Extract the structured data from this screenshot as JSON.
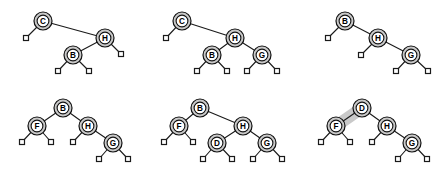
{
  "figure": {
    "background_color": "#ffffff",
    "node_fill": "#c9c9c9",
    "node_inner_fill": "#ffffff",
    "node_stroke": "#111111",
    "edge_color": "#1a1a1a",
    "leaf_fill": "#ffffff",
    "highlight_color": "#c9c9c9",
    "columns": 3,
    "rows": 2,
    "panel_width": 149,
    "panel_height": 88
  },
  "panels": [
    {
      "id": "panel-1",
      "index": 1,
      "x": 0,
      "y": 0,
      "root": "C",
      "node_labels": [
        "C",
        "H",
        "B"
      ],
      "leaf_count": 4,
      "highlight": null,
      "nodes": [
        {
          "label": "C",
          "x": 43,
          "y": 21,
          "r": 9
        },
        {
          "label": "H",
          "x": 105,
          "y": 38,
          "r": 9
        },
        {
          "label": "B",
          "x": 73,
          "y": 55,
          "r": 9
        }
      ],
      "leaves": [
        {
          "x": 26,
          "y": 38,
          "s": 5
        },
        {
          "x": 121,
          "y": 54,
          "s": 5
        },
        {
          "x": 58,
          "y": 71,
          "s": 5
        },
        {
          "x": 89,
          "y": 71,
          "s": 5
        }
      ],
      "edges": [
        {
          "from": "C",
          "to": "leaf",
          "x1": 43,
          "y1": 21,
          "x2": 26,
          "y2": 38
        },
        {
          "from": "C",
          "to": "H",
          "x1": 43,
          "y1": 21,
          "x2": 105,
          "y2": 38
        },
        {
          "from": "H",
          "to": "B",
          "x1": 105,
          "y1": 38,
          "x2": 73,
          "y2": 55
        },
        {
          "from": "H",
          "to": "leaf",
          "x1": 105,
          "y1": 38,
          "x2": 121,
          "y2": 54
        },
        {
          "from": "B",
          "to": "leaf",
          "x1": 73,
          "y1": 55,
          "x2": 58,
          "y2": 71
        },
        {
          "from": "B",
          "to": "leaf",
          "x1": 73,
          "y1": 55,
          "x2": 89,
          "y2": 71
        }
      ]
    },
    {
      "id": "panel-2",
      "index": 2,
      "x": 149,
      "y": 0,
      "root": "C",
      "node_labels": [
        "C",
        "H",
        "B",
        "G"
      ],
      "leaf_count": 5,
      "highlight": null,
      "nodes": [
        {
          "label": "C",
          "x": 33,
          "y": 21,
          "r": 9
        },
        {
          "label": "H",
          "x": 86,
          "y": 38,
          "r": 9
        },
        {
          "label": "B",
          "x": 63,
          "y": 55,
          "r": 9
        },
        {
          "label": "G",
          "x": 113,
          "y": 55,
          "r": 9
        }
      ],
      "leaves": [
        {
          "x": 17,
          "y": 38,
          "s": 5
        },
        {
          "x": 48,
          "y": 71,
          "s": 5
        },
        {
          "x": 78,
          "y": 71,
          "s": 5
        },
        {
          "x": 98,
          "y": 71,
          "s": 5
        },
        {
          "x": 128,
          "y": 71,
          "s": 5
        }
      ],
      "edges": [
        {
          "from": "C",
          "to": "leaf",
          "x1": 33,
          "y1": 21,
          "x2": 17,
          "y2": 38
        },
        {
          "from": "C",
          "to": "H",
          "x1": 33,
          "y1": 21,
          "x2": 86,
          "y2": 38
        },
        {
          "from": "H",
          "to": "B",
          "x1": 86,
          "y1": 38,
          "x2": 63,
          "y2": 55
        },
        {
          "from": "H",
          "to": "G",
          "x1": 86,
          "y1": 38,
          "x2": 113,
          "y2": 55
        },
        {
          "from": "B",
          "to": "leaf",
          "x1": 63,
          "y1": 55,
          "x2": 48,
          "y2": 71
        },
        {
          "from": "B",
          "to": "leaf",
          "x1": 63,
          "y1": 55,
          "x2": 78,
          "y2": 71
        },
        {
          "from": "G",
          "to": "leaf",
          "x1": 113,
          "y1": 55,
          "x2": 98,
          "y2": 71
        },
        {
          "from": "G",
          "to": "leaf",
          "x1": 113,
          "y1": 55,
          "x2": 128,
          "y2": 71
        }
      ]
    },
    {
      "id": "panel-3",
      "index": 3,
      "x": 298,
      "y": 0,
      "root": "B",
      "node_labels": [
        "B",
        "H",
        "G"
      ],
      "leaf_count": 4,
      "highlight": null,
      "nodes": [
        {
          "label": "B",
          "x": 47,
          "y": 21,
          "r": 9
        },
        {
          "label": "H",
          "x": 80,
          "y": 38,
          "r": 9
        },
        {
          "label": "G",
          "x": 113,
          "y": 55,
          "r": 9
        }
      ],
      "leaves": [
        {
          "x": 30,
          "y": 38,
          "s": 5
        },
        {
          "x": 63,
          "y": 55,
          "s": 5
        },
        {
          "x": 98,
          "y": 71,
          "s": 5
        },
        {
          "x": 130,
          "y": 71,
          "s": 5
        }
      ],
      "edges": [
        {
          "from": "B",
          "to": "leaf",
          "x1": 47,
          "y1": 21,
          "x2": 30,
          "y2": 38
        },
        {
          "from": "B",
          "to": "H",
          "x1": 47,
          "y1": 21,
          "x2": 80,
          "y2": 38
        },
        {
          "from": "H",
          "to": "leaf",
          "x1": 80,
          "y1": 38,
          "x2": 63,
          "y2": 55
        },
        {
          "from": "H",
          "to": "G",
          "x1": 80,
          "y1": 38,
          "x2": 113,
          "y2": 55
        },
        {
          "from": "G",
          "to": "leaf",
          "x1": 113,
          "y1": 55,
          "x2": 98,
          "y2": 71
        },
        {
          "from": "G",
          "to": "leaf",
          "x1": 113,
          "y1": 55,
          "x2": 130,
          "y2": 71
        }
      ]
    },
    {
      "id": "panel-4",
      "index": 4,
      "x": 0,
      "y": 88,
      "root": "B",
      "node_labels": [
        "B",
        "F",
        "H",
        "G"
      ],
      "leaf_count": 5,
      "highlight": null,
      "nodes": [
        {
          "label": "B",
          "x": 63,
          "y": 20,
          "r": 9
        },
        {
          "label": "F",
          "x": 37,
          "y": 38,
          "r": 9
        },
        {
          "label": "H",
          "x": 88,
          "y": 38,
          "r": 9
        },
        {
          "label": "G",
          "x": 113,
          "y": 55,
          "r": 9
        }
      ],
      "leaves": [
        {
          "x": 22,
          "y": 54,
          "s": 5
        },
        {
          "x": 51,
          "y": 54,
          "s": 5
        },
        {
          "x": 73,
          "y": 54,
          "s": 5
        },
        {
          "x": 99,
          "y": 71,
          "s": 5
        },
        {
          "x": 128,
          "y": 71,
          "s": 5
        }
      ],
      "edges": [
        {
          "from": "B",
          "to": "F",
          "x1": 63,
          "y1": 20,
          "x2": 37,
          "y2": 38
        },
        {
          "from": "B",
          "to": "H",
          "x1": 63,
          "y1": 20,
          "x2": 88,
          "y2": 38
        },
        {
          "from": "F",
          "to": "leaf",
          "x1": 37,
          "y1": 38,
          "x2": 22,
          "y2": 54
        },
        {
          "from": "F",
          "to": "leaf",
          "x1": 37,
          "y1": 38,
          "x2": 51,
          "y2": 54
        },
        {
          "from": "H",
          "to": "leaf",
          "x1": 88,
          "y1": 38,
          "x2": 73,
          "y2": 54
        },
        {
          "from": "H",
          "to": "G",
          "x1": 88,
          "y1": 38,
          "x2": 113,
          "y2": 55
        },
        {
          "from": "G",
          "to": "leaf",
          "x1": 113,
          "y1": 55,
          "x2": 99,
          "y2": 71
        },
        {
          "from": "G",
          "to": "leaf",
          "x1": 113,
          "y1": 55,
          "x2": 128,
          "y2": 71
        }
      ]
    },
    {
      "id": "panel-5",
      "index": 5,
      "x": 149,
      "y": 88,
      "root": "B",
      "node_labels": [
        "B",
        "F",
        "H",
        "D",
        "G"
      ],
      "leaf_count": 6,
      "highlight": null,
      "nodes": [
        {
          "label": "B",
          "x": 51,
          "y": 20,
          "r": 9
        },
        {
          "label": "F",
          "x": 30,
          "y": 38,
          "r": 9
        },
        {
          "label": "H",
          "x": 94,
          "y": 38,
          "r": 9
        },
        {
          "label": "D",
          "x": 68,
          "y": 55,
          "r": 9
        },
        {
          "label": "G",
          "x": 118,
          "y": 55,
          "r": 9
        }
      ],
      "leaves": [
        {
          "x": 15,
          "y": 54,
          "s": 5
        },
        {
          "x": 44,
          "y": 54,
          "s": 5
        },
        {
          "x": 54,
          "y": 71,
          "s": 5
        },
        {
          "x": 83,
          "y": 71,
          "s": 5
        },
        {
          "x": 104,
          "y": 71,
          "s": 5
        },
        {
          "x": 133,
          "y": 71,
          "s": 5
        }
      ],
      "edges": [
        {
          "from": "B",
          "to": "F",
          "x1": 51,
          "y1": 20,
          "x2": 30,
          "y2": 38
        },
        {
          "from": "B",
          "to": "H",
          "x1": 51,
          "y1": 20,
          "x2": 94,
          "y2": 38
        },
        {
          "from": "F",
          "to": "leaf",
          "x1": 30,
          "y1": 38,
          "x2": 15,
          "y2": 54
        },
        {
          "from": "F",
          "to": "leaf",
          "x1": 30,
          "y1": 38,
          "x2": 44,
          "y2": 54
        },
        {
          "from": "H",
          "to": "D",
          "x1": 94,
          "y1": 38,
          "x2": 68,
          "y2": 55
        },
        {
          "from": "H",
          "to": "G",
          "x1": 94,
          "y1": 38,
          "x2": 118,
          "y2": 55
        },
        {
          "from": "D",
          "to": "leaf",
          "x1": 68,
          "y1": 55,
          "x2": 54,
          "y2": 71
        },
        {
          "from": "D",
          "to": "leaf",
          "x1": 68,
          "y1": 55,
          "x2": 83,
          "y2": 71
        },
        {
          "from": "G",
          "to": "leaf",
          "x1": 118,
          "y1": 55,
          "x2": 104,
          "y2": 71
        },
        {
          "from": "G",
          "to": "leaf",
          "x1": 118,
          "y1": 55,
          "x2": 133,
          "y2": 71
        }
      ]
    },
    {
      "id": "panel-6",
      "index": 6,
      "x": 298,
      "y": 88,
      "root": "D",
      "node_labels": [
        "D",
        "F",
        "H",
        "G"
      ],
      "leaf_count": 5,
      "highlight": {
        "from": "F",
        "to": "D",
        "x1": 38,
        "y1": 38,
        "x2": 64,
        "y2": 20
      },
      "nodes": [
        {
          "label": "D",
          "x": 64,
          "y": 20,
          "r": 9
        },
        {
          "label": "F",
          "x": 38,
          "y": 38,
          "r": 9
        },
        {
          "label": "H",
          "x": 89,
          "y": 38,
          "r": 9
        },
        {
          "label": "G",
          "x": 114,
          "y": 55,
          "r": 9
        }
      ],
      "leaves": [
        {
          "x": 23,
          "y": 54,
          "s": 5
        },
        {
          "x": 52,
          "y": 54,
          "s": 5
        },
        {
          "x": 74,
          "y": 54,
          "s": 5
        },
        {
          "x": 100,
          "y": 71,
          "s": 5
        },
        {
          "x": 129,
          "y": 71,
          "s": 5
        }
      ],
      "edges": [
        {
          "from": "D",
          "to": "F",
          "x1": 64,
          "y1": 20,
          "x2": 38,
          "y2": 38
        },
        {
          "from": "D",
          "to": "H",
          "x1": 64,
          "y1": 20,
          "x2": 89,
          "y2": 38
        },
        {
          "from": "F",
          "to": "leaf",
          "x1": 38,
          "y1": 38,
          "x2": 23,
          "y2": 54
        },
        {
          "from": "F",
          "to": "leaf",
          "x1": 38,
          "y1": 38,
          "x2": 52,
          "y2": 54
        },
        {
          "from": "H",
          "to": "leaf",
          "x1": 89,
          "y1": 38,
          "x2": 74,
          "y2": 54
        },
        {
          "from": "H",
          "to": "G",
          "x1": 89,
          "y1": 38,
          "x2": 114,
          "y2": 55
        },
        {
          "from": "G",
          "to": "leaf",
          "x1": 114,
          "y1": 55,
          "x2": 100,
          "y2": 71
        },
        {
          "from": "G",
          "to": "leaf",
          "x1": 114,
          "y1": 55,
          "x2": 129,
          "y2": 71
        }
      ]
    }
  ]
}
